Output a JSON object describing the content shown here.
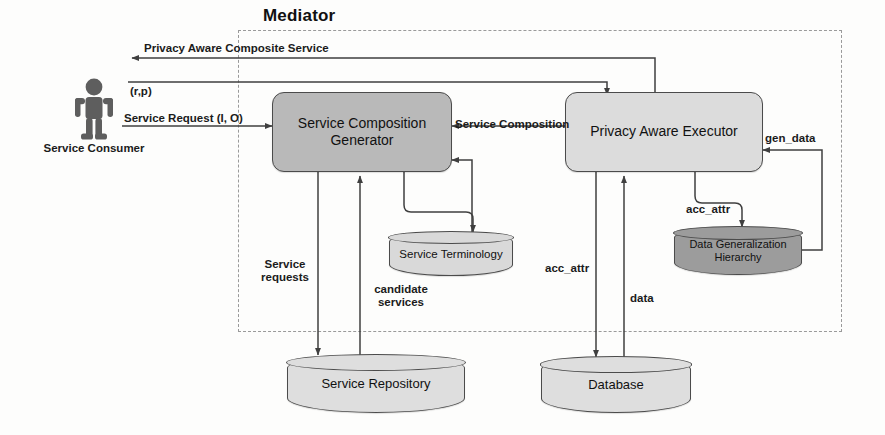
{
  "diagram": {
    "mediator_label": "Mediator"
  },
  "actors": [
    {
      "id": "service-consumer",
      "label": "Service Consumer",
      "icon": "person-icon"
    }
  ],
  "nodes": [
    {
      "id": "service-composition-generator",
      "label": "Service\nComposition\nGenerator",
      "shape": "rounded-box",
      "fill": "#b9b9b9"
    },
    {
      "id": "privacy-aware-executor",
      "label": "Privacy Aware\nExecutor",
      "shape": "rounded-box",
      "fill": "#dcdcdc"
    },
    {
      "id": "service-terminology",
      "label": "Service Terminology",
      "shape": "cylinder",
      "fill": "#d9d9d9"
    },
    {
      "id": "data-generalization-hierarchy",
      "label": "Data Generalization\nHierarchy",
      "shape": "cylinder",
      "fill": "#9c9c9c"
    },
    {
      "id": "service-repository",
      "label": "Service Repository",
      "shape": "cylinder",
      "fill": "#dedede"
    },
    {
      "id": "database",
      "label": "Database",
      "shape": "cylinder",
      "fill": "#dedede"
    }
  ],
  "edge_labels": [
    {
      "id": "privacy-aware-composite-service",
      "text": "Privacy Aware Composite Service"
    },
    {
      "id": "r-p",
      "text": "(r,p)"
    },
    {
      "id": "service-request",
      "text": "Service Request (I, O)"
    },
    {
      "id": "service-composition",
      "text": "Service Composition"
    },
    {
      "id": "service-requests",
      "text": "Service\nrequests"
    },
    {
      "id": "candidate-services",
      "text": "candidate\nservices"
    },
    {
      "id": "acc-attr-db",
      "text": "acc_attr"
    },
    {
      "id": "data",
      "text": "data"
    },
    {
      "id": "acc-attr-dgh",
      "text": "acc_attr"
    },
    {
      "id": "gen-data",
      "text": "gen_data"
    }
  ],
  "colors": {
    "line": "#3f3f3f",
    "dashed_boundary": "#9a9a9a",
    "generator_fill": "#b9b9b9",
    "executor_fill": "#dcdcdc",
    "dgh_fill": "#9c9c9c",
    "store_fill": "#dedede",
    "person_fill": "#5e5e5e"
  }
}
